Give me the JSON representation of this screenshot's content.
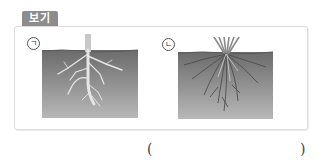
{
  "badge": {
    "label": "보기"
  },
  "items": [
    {
      "marker": "ㄱ",
      "description": "taproot system: thick main root with thinner lateral roots in soil"
    },
    {
      "marker": "ㄴ",
      "description": "fibrous root system: many thin roots spreading from grass base in soil"
    }
  ],
  "answer": {
    "open": "(",
    "close": ")",
    "value": ""
  },
  "colors": {
    "badge": "#8c8c8c",
    "soil_top": "#6e6e6e",
    "soil_bottom": "#b4b4b4",
    "root": "#e8e8e8"
  }
}
